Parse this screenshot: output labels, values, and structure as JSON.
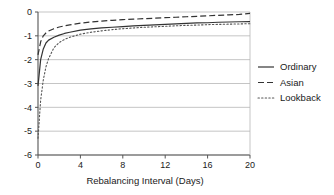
{
  "chart_data": {
    "type": "line",
    "title": "",
    "xlabel": "Rebalancing Interval (Days)",
    "ylabel": "",
    "xlim": [
      0,
      20
    ],
    "ylim": [
      -6,
      0
    ],
    "xticks": [
      0,
      4,
      8,
      12,
      16,
      20
    ],
    "xtick_labels": [
      "0",
      "4",
      "8",
      "12",
      "16",
      "20"
    ],
    "yticks": [
      0,
      -1,
      -2,
      -3,
      -4,
      -5,
      -6
    ],
    "ytick_labels": [
      "0",
      "-1",
      "-2",
      "-3",
      "-4",
      "-5",
      "-6"
    ],
    "grid": true,
    "grid_axis": "y",
    "legend_position": "right",
    "x": [
      0,
      0.25,
      0.5,
      0.75,
      1,
      1.5,
      2,
      2.5,
      3,
      4,
      5,
      6,
      7,
      8,
      9,
      10,
      11,
      12,
      13,
      14,
      15,
      16,
      17,
      18,
      19,
      20
    ],
    "series": [
      {
        "name": "Ordinary",
        "style": "solid",
        "color": "#333333",
        "values": [
          -3.1,
          -2.0,
          -1.55,
          -1.3,
          -1.18,
          -1.06,
          -0.97,
          -0.9,
          -0.85,
          -0.76,
          -0.71,
          -0.67,
          -0.64,
          -0.61,
          -0.58,
          -0.56,
          -0.54,
          -0.52,
          -0.5,
          -0.48,
          -0.46,
          -0.45,
          -0.43,
          -0.42,
          -0.41,
          -0.4
        ]
      },
      {
        "name": "Asian",
        "style": "dashed",
        "color": "#333333",
        "values": [
          -1.8,
          -1.25,
          -1.0,
          -0.88,
          -0.8,
          -0.7,
          -0.63,
          -0.58,
          -0.54,
          -0.47,
          -0.42,
          -0.38,
          -0.35,
          -0.32,
          -0.3,
          -0.28,
          -0.26,
          -0.24,
          -0.22,
          -0.2,
          -0.18,
          -0.16,
          -0.14,
          -0.12,
          -0.1,
          -0.06
        ]
      },
      {
        "name": "Lookback",
        "style": "dotted",
        "color": "#555555",
        "values": [
          -5.3,
          -3.7,
          -2.85,
          -2.3,
          -1.95,
          -1.5,
          -1.28,
          -1.15,
          -1.06,
          -0.93,
          -0.85,
          -0.79,
          -0.74,
          -0.7,
          -0.67,
          -0.64,
          -0.62,
          -0.6,
          -0.58,
          -0.56,
          -0.55,
          -0.53,
          -0.52,
          -0.51,
          -0.5,
          -0.49
        ]
      }
    ]
  },
  "legend": {
    "items": [
      {
        "label": "Ordinary"
      },
      {
        "label": "Asian"
      },
      {
        "label": "Lookback"
      }
    ]
  },
  "axes": {
    "x_title": "Rebalancing Interval (Days)"
  }
}
